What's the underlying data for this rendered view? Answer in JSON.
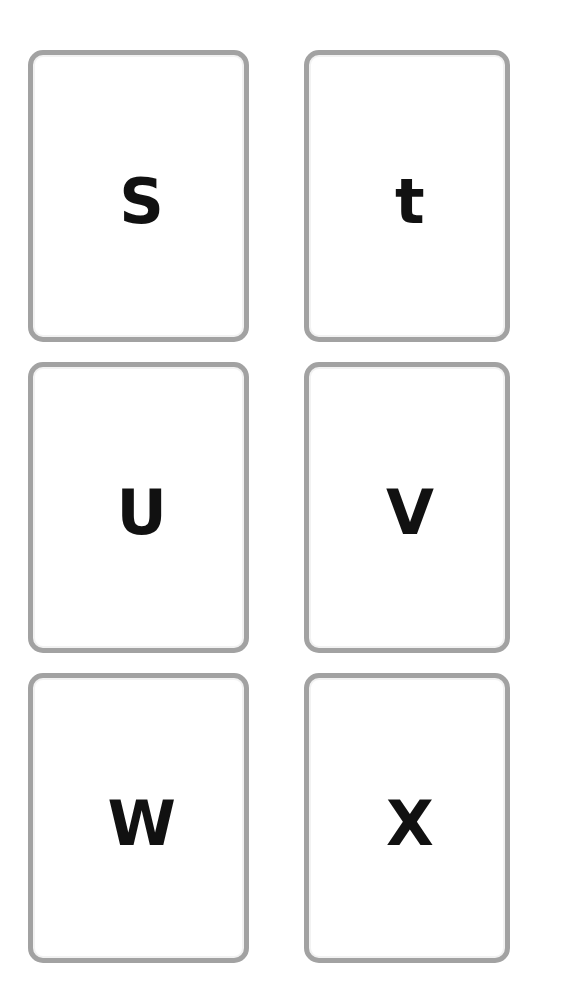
{
  "sheet": {
    "title": "Alphabet Flashcards",
    "background_color": "#ffffff",
    "width": 563,
    "height": 994,
    "columns": 2,
    "rows": 3
  },
  "card_style": {
    "fill_color": "#ffffff",
    "border_color": "#a2a2a2",
    "inner_edge_color": "#f2f2f2",
    "letter_color": "#111111",
    "border_width_px": 5,
    "corner_radius_px": 15
  },
  "cards": [
    {
      "id": "card-s",
      "letter": "S",
      "letter_case": "uppercase",
      "row": 1,
      "column": "left"
    },
    {
      "id": "card-t",
      "letter": "t",
      "letter_case": "lowercase",
      "row": 1,
      "column": "right"
    },
    {
      "id": "card-u",
      "letter": "U",
      "letter_case": "uppercase",
      "row": 2,
      "column": "left"
    },
    {
      "id": "card-v",
      "letter": "V",
      "letter_case": "uppercase",
      "row": 2,
      "column": "right"
    },
    {
      "id": "card-w",
      "letter": "W",
      "letter_case": "uppercase",
      "row": 3,
      "column": "left"
    },
    {
      "id": "card-x",
      "letter": "X",
      "letter_case": "uppercase",
      "row": 3,
      "column": "right"
    }
  ]
}
